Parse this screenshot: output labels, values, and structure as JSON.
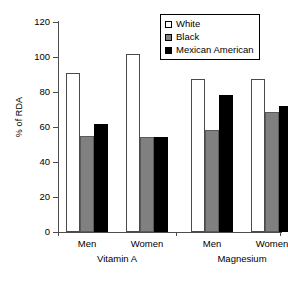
{
  "chart_data": {
    "type": "bar",
    "title": "",
    "xlabel": "",
    "ylabel": "% of RDA",
    "ylim": [
      0,
      120
    ],
    "yticks": [
      0,
      20,
      40,
      60,
      80,
      100,
      120
    ],
    "grid": false,
    "legend_position": "top-right",
    "categories": [
      "Men",
      "Women",
      "Men",
      "Women"
    ],
    "group_labels": [
      "Vitamin A",
      "Magnesium"
    ],
    "groups": [
      {
        "nutrient": "Vitamin A",
        "sex": "Men"
      },
      {
        "nutrient": "Vitamin A",
        "sex": "Women"
      },
      {
        "nutrient": "Magnesium",
        "sex": "Men"
      },
      {
        "nutrient": "Magnesium",
        "sex": "Women"
      }
    ],
    "series": [
      {
        "name": "White",
        "color": "#ffffff",
        "values": [
          91,
          102,
          87.5,
          87.5
        ]
      },
      {
        "name": "Black",
        "color": "#808080",
        "values": [
          55,
          54.5,
          58.5,
          68.5
        ]
      },
      {
        "name": "Mexican American",
        "color": "#000000",
        "values": [
          61.5,
          54.5,
          78.5,
          72
        ]
      }
    ]
  },
  "axis": {
    "y_title": "% of RDA",
    "y_tick_labels": [
      "120",
      "100",
      "80",
      "60",
      "40",
      "20",
      "0"
    ],
    "x_tick_labels": [
      "Men",
      "Women",
      "Men",
      "Women"
    ],
    "x_group_labels": [
      "Vitamin A",
      "Magnesium"
    ]
  },
  "legend": {
    "entries": [
      {
        "label": "White",
        "swatch": "white-square-icon"
      },
      {
        "label": "Black",
        "swatch": "gray-square-icon"
      },
      {
        "label": "Mexican American",
        "swatch": "black-square-icon"
      }
    ]
  }
}
